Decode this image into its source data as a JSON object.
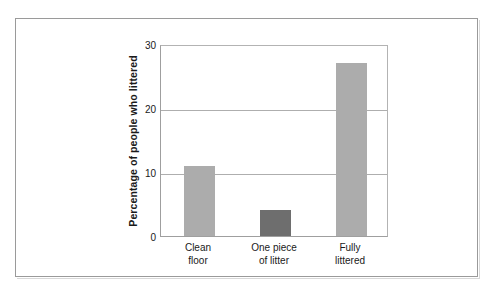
{
  "chart_data": {
    "type": "bar",
    "title": "",
    "subtitle": "",
    "xlabel": "",
    "ylabel": "Percentage of people who littered",
    "categories": [
      "Clean floor",
      "One piece of litter",
      "Fully littered"
    ],
    "category_lines": [
      [
        "Clean",
        "floor"
      ],
      [
        "One piece",
        "of litter"
      ],
      [
        "Fully",
        "littered"
      ]
    ],
    "values": [
      11,
      4,
      27
    ],
    "bar_colors": [
      "#ACACAC",
      "#6E6E6E",
      "#ACACAC"
    ],
    "ylim": [
      0,
      30
    ],
    "yticks": [
      0,
      10,
      20,
      30
    ],
    "ytick_labels": [
      "0",
      "10",
      "20",
      "30"
    ],
    "gridlines": [
      10,
      20
    ],
    "grid": true,
    "legend": "none",
    "legend_position": "none",
    "frame_color": "#9a9a9a",
    "axis_color": "#9f9f9f",
    "grid_color": "#aeaeae",
    "text_color": "#1a1a1a"
  }
}
